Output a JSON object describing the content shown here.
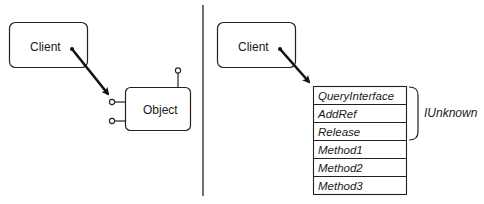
{
  "left_diagram": {
    "client_label": "Client",
    "object_label": "Object"
  },
  "right_diagram": {
    "client_label": "Client",
    "vtable_rows": [
      "QueryInterface",
      "AddRef",
      "Release",
      "Method1",
      "Method2",
      "Method3"
    ],
    "brace_label": "IUnknown"
  }
}
